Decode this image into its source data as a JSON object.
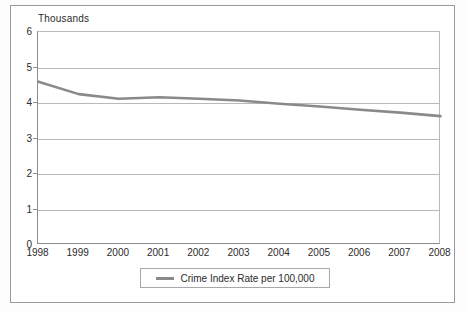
{
  "figure": {
    "unit_label": "Thousands"
  },
  "legend": {
    "entries": [
      {
        "label": "Crime Index Rate per 100,000",
        "color": "#8a8a8a",
        "marker": "line-swatch"
      }
    ],
    "position": "bottom-center",
    "boxed": true
  },
  "colors": {
    "series_line": "#8a8a8a",
    "gridline": "#b9b9b9",
    "axis": "#8c8c8c",
    "frame": "#9a9a9a",
    "text": "#2b2b2b",
    "background": "#ffffff"
  },
  "chart_data": {
    "type": "line",
    "title": "",
    "subtitle": "",
    "xlabel": "",
    "ylabel": "Thousands",
    "x": [
      1998,
      1999,
      2000,
      2001,
      2002,
      2003,
      2004,
      2005,
      2006,
      2007,
      2008
    ],
    "categories": [
      "1998",
      "1999",
      "2000",
      "2001",
      "2002",
      "2003",
      "2004",
      "2005",
      "2006",
      "2007",
      "2008"
    ],
    "series": [
      {
        "name": "Crime Index Rate per 100,000",
        "color": "#8a8a8a",
        "values": [
          4.6,
          4.25,
          4.12,
          4.16,
          4.12,
          4.07,
          3.98,
          3.9,
          3.81,
          3.73,
          3.63
        ]
      }
    ],
    "values": [
      4.6,
      4.25,
      4.12,
      4.16,
      4.12,
      4.07,
      3.98,
      3.9,
      3.81,
      3.73,
      3.63
    ],
    "xlim": [
      1998,
      2008
    ],
    "ylim": [
      0,
      6
    ],
    "yticks": [
      0,
      1,
      2,
      3,
      4,
      5,
      6
    ],
    "ytick_labels": [
      "0",
      "1",
      "2",
      "3",
      "4",
      "5",
      "6"
    ],
    "xticks": [
      1998,
      1999,
      2000,
      2001,
      2002,
      2003,
      2004,
      2005,
      2006,
      2007,
      2008
    ],
    "xtick_labels": [
      "1998",
      "1999",
      "2000",
      "2001",
      "2002",
      "2003",
      "2004",
      "2005",
      "2006",
      "2007",
      "2008"
    ],
    "grid": {
      "horizontal": true,
      "vertical": false
    },
    "legend_position": "bottom-center",
    "units": "thousands",
    "annotations": []
  }
}
